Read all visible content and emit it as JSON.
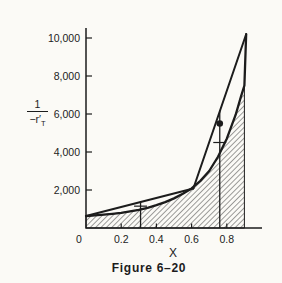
{
  "figure": {
    "caption": "Figure 6–20",
    "background": "#fbfaf6",
    "ink": "#1c1c1c"
  },
  "chart_data": {
    "type": "line",
    "title": "Figure 6–20",
    "xlabel": "X",
    "ylabel": "1/(-r'T)",
    "ylabel_fraction": {
      "numerator": "1",
      "denominator": "−r′",
      "denominator_sub": "T"
    },
    "xlim": [
      0,
      0.97
    ],
    "ylim": [
      0,
      10600
    ],
    "grid": false,
    "legend": "none",
    "x_ticks": [
      {
        "v": 0,
        "label": "0"
      },
      {
        "v": 0.2,
        "label": "0.2"
      },
      {
        "v": 0.4,
        "label": "0.4"
      },
      {
        "v": 0.6,
        "label": "0.6"
      },
      {
        "v": 0.8,
        "label": "0.8"
      }
    ],
    "y_ticks": [
      {
        "v": 2000,
        "label": "2,000"
      },
      {
        "v": 4000,
        "label": "4,000"
      },
      {
        "v": 6000,
        "label": "6,000"
      },
      {
        "v": 8000,
        "label": "8,000"
      },
      {
        "v": 10000,
        "label": "10,000"
      }
    ],
    "series": [
      {
        "name": "rate-curve",
        "style": "curve",
        "x": [
          0,
          0.05,
          0.1,
          0.15,
          0.2,
          0.25,
          0.3,
          0.35,
          0.4,
          0.45,
          0.5,
          0.55,
          0.6,
          0.65,
          0.7,
          0.75,
          0.8,
          0.85,
          0.88,
          0.9,
          0.91
        ],
        "y": [
          630,
          660,
          700,
          748,
          800,
          870,
          950,
          1060,
          1200,
          1360,
          1560,
          1800,
          2080,
          2480,
          3000,
          3750,
          4700,
          5950,
          6900,
          7500,
          10200
        ]
      },
      {
        "name": "operating-line-1",
        "style": "straight",
        "x": [
          0,
          0.61
        ],
        "y": [
          630,
          2080
        ]
      },
      {
        "name": "operating-line-2",
        "style": "straight",
        "x": [
          0.61,
          0.91
        ],
        "y": [
          2080,
          10200
        ]
      }
    ],
    "hatched_region": {
      "under": "rate-curve",
      "x_start": 0,
      "x_end": 0.9,
      "y_at_end": 7500,
      "pattern": "diagonal-hatch"
    },
    "markers": [
      {
        "name": "marker-line-1",
        "x": 0.31,
        "y_top": 1400,
        "tick_y": 1150
      },
      {
        "name": "marker-line-2",
        "x": 0.76,
        "y_top": 6200,
        "tick_y": 4500,
        "dot_y": 5500
      }
    ]
  }
}
